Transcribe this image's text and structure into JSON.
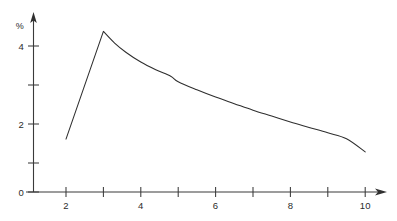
{
  "chart_data": {
    "type": "line",
    "title": "",
    "subtitle": "",
    "xlabel": "",
    "ylabel": "%",
    "xlim": [
      1.4,
      10.6
    ],
    "ylim": [
      0,
      4.85
    ],
    "grid": false,
    "legend": null,
    "x_ticks": [
      2,
      3,
      4,
      5,
      6,
      7,
      8,
      9,
      10
    ],
    "x_tick_labels": [
      "2",
      "",
      "4",
      "",
      "6",
      "",
      "8",
      "",
      "10"
    ],
    "y_ticks": [
      0,
      1,
      2,
      3,
      4
    ],
    "y_tick_labels": [
      "0",
      "",
      "2",
      "",
      "4"
    ],
    "series": [
      {
        "name": "percent",
        "x": [
          2.0,
          3.0,
          3.3,
          3.6,
          4.0,
          4.4,
          4.8,
          5.0,
          5.5,
          6.0,
          6.5,
          7.0,
          7.5,
          8.0,
          8.5,
          9.0,
          9.5,
          10.0
        ],
        "values": [
          1.45,
          4.4,
          4.08,
          3.83,
          3.56,
          3.35,
          3.17,
          3.02,
          2.8,
          2.6,
          2.42,
          2.24,
          2.08,
          1.92,
          1.77,
          1.62,
          1.46,
          1.1
        ]
      }
    ],
    "annotations": [],
    "colors": {
      "curve": "#2e2e2e",
      "axis": "#3a3a3a",
      "text": "#2b2b2b",
      "background": "#ffffff"
    },
    "axis_arrows": {
      "x_axis_arrow": true,
      "y_axis_arrow": true
    }
  },
  "labels": {
    "y_axis_title": "%",
    "x_tick_2": "2",
    "x_tick_4": "4",
    "x_tick_6": "6",
    "x_tick_8": "8",
    "x_tick_10": "10",
    "y_tick_0": "0",
    "y_tick_2": "2",
    "y_tick_4": "4"
  }
}
